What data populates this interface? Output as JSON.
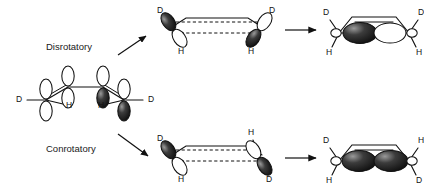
{
  "diagram": {
    "background_color": "#ffffff",
    "line_color": "#111111",
    "lobe_dark_color": "#141414",
    "lobe_light_color": "#ffffff"
  },
  "pathways": {
    "disrotatory": {
      "label": "Disrotatory",
      "arrow": "diagonal-up-right-arrow"
    },
    "conrotatory": {
      "label": "Conrotatory",
      "arrow": "diagonal-down-right-arrow"
    }
  },
  "reactant": {
    "name": "butadiene-s-cis-diene",
    "orbital_count": 4,
    "substituents": [
      {
        "position": "terminal-left-up",
        "label": "D"
      },
      {
        "position": "terminal-left-down",
        "label": "H"
      },
      {
        "position": "terminal-right-down",
        "label": "H"
      },
      {
        "position": "terminal-right-up",
        "label": "D"
      }
    ]
  },
  "disrotatory_ts": {
    "name": "disrotatory-transition-state",
    "labels": [
      {
        "position": "left-up",
        "label": "D"
      },
      {
        "position": "left-down",
        "label": "H"
      },
      {
        "position": "right-up",
        "label": "D"
      },
      {
        "position": "right-down",
        "label": "H"
      }
    ],
    "reaction_arrow": "right-arrow"
  },
  "disrotatory_product": {
    "name": "cis-cyclobutene-product",
    "labels": [
      {
        "position": "left-up",
        "label": "D"
      },
      {
        "position": "left-down",
        "label": "H"
      },
      {
        "position": "right-up",
        "label": "D"
      },
      {
        "position": "right-down",
        "label": "H"
      }
    ]
  },
  "conrotatory_ts": {
    "name": "conrotatory-transition-state",
    "labels": [
      {
        "position": "left-up",
        "label": "D"
      },
      {
        "position": "left-down",
        "label": "H"
      },
      {
        "position": "right-up",
        "label": "H"
      },
      {
        "position": "right-down",
        "label": "D"
      }
    ],
    "reaction_arrow": "right-arrow"
  },
  "conrotatory_product": {
    "name": "trans-cyclobutene-product",
    "labels": [
      {
        "position": "left-up",
        "label": "D"
      },
      {
        "position": "left-down",
        "label": "H"
      },
      {
        "position": "right-up",
        "label": "H"
      },
      {
        "position": "right-down",
        "label": "D"
      }
    ]
  }
}
